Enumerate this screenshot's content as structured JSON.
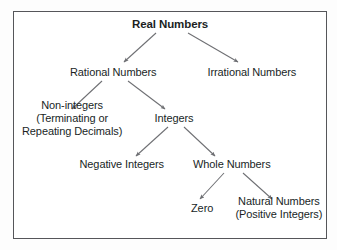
{
  "diagram": {
    "border_color": "#55565a",
    "background_color": "#ffffff",
    "text_color": "#201f1f",
    "arrow_color": "#6e6f73",
    "nodes": [
      {
        "id": "real",
        "label": "Real Numbers",
        "lines": [
          "Real Numbers"
        ],
        "bold": true,
        "cx": 170,
        "cy": 24
      },
      {
        "id": "rational",
        "label": "Rational Numbers",
        "lines": [
          "Rational Numbers"
        ],
        "bold": false,
        "cx": 113,
        "cy": 72
      },
      {
        "id": "irrational",
        "label": "Irrational Numbers",
        "lines": [
          "Irrational Numbers"
        ],
        "bold": false,
        "cx": 252,
        "cy": 72
      },
      {
        "id": "noninteger",
        "label": "Non-integers (Terminating or Repeating Decimals)",
        "lines": [
          "Non-integers",
          "(Terminating or",
          "Repeating Decimals)"
        ],
        "bold": false,
        "cx": 72,
        "cy": 118
      },
      {
        "id": "integers",
        "label": "Integers",
        "lines": [
          "Integers"
        ],
        "bold": false,
        "cx": 174,
        "cy": 118
      },
      {
        "id": "negative",
        "label": "Negative Integers",
        "lines": [
          "Negative Integers"
        ],
        "bold": false,
        "cx": 122,
        "cy": 164
      },
      {
        "id": "whole",
        "label": "Whole Numbers",
        "lines": [
          "Whole Numbers"
        ],
        "bold": false,
        "cx": 232,
        "cy": 164
      },
      {
        "id": "zero",
        "label": "Zero",
        "lines": [
          "Zero"
        ],
        "bold": false,
        "cx": 202,
        "cy": 208
      },
      {
        "id": "natural",
        "label": "Natural Numbers (Positive Integers)",
        "lines": [
          "Natural Numbers",
          "(Positive Integers)"
        ],
        "bold": false,
        "cx": 279,
        "cy": 208
      }
    ],
    "edges": [
      {
        "from": "real",
        "to": "rational",
        "x1": 156,
        "y1": 33,
        "x2": 124,
        "y2": 62
      },
      {
        "from": "real",
        "to": "irrational",
        "x1": 188,
        "y1": 33,
        "x2": 238,
        "y2": 62
      },
      {
        "from": "rational",
        "to": "noninteger",
        "x1": 102,
        "y1": 81,
        "x2": 72,
        "y2": 109
      },
      {
        "from": "rational",
        "to": "integers",
        "x1": 128,
        "y1": 81,
        "x2": 165,
        "y2": 109
      },
      {
        "from": "integers",
        "to": "negative",
        "x1": 168,
        "y1": 127,
        "x2": 136,
        "y2": 156
      },
      {
        "from": "integers",
        "to": "whole",
        "x1": 184,
        "y1": 127,
        "x2": 215,
        "y2": 156
      },
      {
        "from": "whole",
        "to": "zero",
        "x1": 224,
        "y1": 173,
        "x2": 200,
        "y2": 199
      },
      {
        "from": "whole",
        "to": "natural",
        "x1": 243,
        "y1": 173,
        "x2": 272,
        "y2": 199
      }
    ]
  }
}
